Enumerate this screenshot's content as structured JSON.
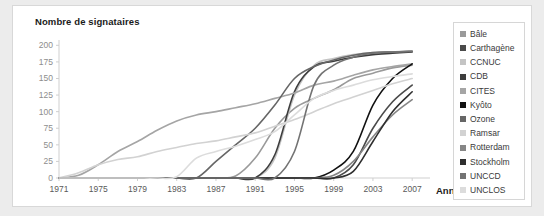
{
  "card": {
    "background": "#ffffff",
    "page_background": "#ececec"
  },
  "chart_data": {
    "type": "line",
    "title": "Nombre de signataires",
    "xlabel": "Année",
    "ylabel": "Nombre de signataires",
    "xlim": [
      1971,
      2008
    ],
    "ylim": [
      0,
      205
    ],
    "grid": false,
    "legend_position": "right",
    "xticks": [
      1971,
      1975,
      1979,
      1983,
      1987,
      1991,
      1995,
      1999,
      2003,
      2007
    ],
    "yticks": [
      0,
      25,
      50,
      75,
      100,
      125,
      150,
      175,
      200
    ],
    "x": [
      1971,
      1973,
      1975,
      1977,
      1979,
      1981,
      1983,
      1985,
      1987,
      1989,
      1991,
      1993,
      1995,
      1997,
      1999,
      2001,
      2003,
      2005,
      2007
    ],
    "series": [
      {
        "name": "Bâle",
        "color": "#9a9a9a",
        "values": [
          0,
          0,
          0,
          0,
          0,
          0,
          0,
          0,
          0,
          3,
          30,
          75,
          105,
          120,
          133,
          150,
          158,
          166,
          170
        ]
      },
      {
        "name": "Carthagène",
        "color": "#4a4a4a",
        "values": [
          0,
          0,
          0,
          0,
          0,
          0,
          0,
          0,
          0,
          0,
          0,
          0,
          0,
          0,
          0,
          20,
          75,
          115,
          140
        ]
      },
      {
        "name": "CCNUC",
        "color": "#c4c4c4",
        "values": [
          0,
          0,
          0,
          0,
          0,
          0,
          0,
          0,
          0,
          0,
          0,
          30,
          125,
          170,
          180,
          186,
          189,
          190,
          191
        ]
      },
      {
        "name": "CDB",
        "color": "#3d3d3d",
        "values": [
          0,
          0,
          0,
          0,
          0,
          0,
          0,
          0,
          0,
          0,
          0,
          35,
          130,
          168,
          176,
          182,
          186,
          188,
          190
        ]
      },
      {
        "name": "CITES",
        "color": "#a5a5a5",
        "values": [
          0,
          4,
          20,
          40,
          55,
          72,
          86,
          95,
          100,
          106,
          112,
          120,
          128,
          140,
          146,
          155,
          163,
          168,
          172
        ]
      },
      {
        "name": "Kyôto",
        "color": "#111111",
        "values": [
          0,
          0,
          0,
          0,
          0,
          0,
          0,
          0,
          0,
          0,
          0,
          0,
          0,
          0,
          12,
          40,
          110,
          150,
          172
        ]
      },
      {
        "name": "Ozone",
        "color": "#666666",
        "values": [
          0,
          0,
          0,
          0,
          0,
          0,
          0,
          0,
          25,
          50,
          75,
          110,
          150,
          168,
          178,
          185,
          189,
          190,
          191
        ]
      },
      {
        "name": "Ramsar",
        "color": "#d2d2d2",
        "values": [
          0,
          8,
          20,
          28,
          32,
          40,
          46,
          52,
          56,
          62,
          68,
          78,
          88,
          100,
          112,
          122,
          132,
          142,
          150
        ]
      },
      {
        "name": "Rotterdam",
        "color": "#868686",
        "values": [
          0,
          0,
          0,
          0,
          0,
          0,
          0,
          0,
          0,
          0,
          0,
          0,
          0,
          0,
          4,
          25,
          62,
          95,
          118
        ]
      },
      {
        "name": "Stockholm",
        "color": "#2e2e2e",
        "values": [
          0,
          0,
          0,
          0,
          0,
          0,
          0,
          0,
          0,
          0,
          0,
          0,
          0,
          0,
          0,
          10,
          55,
          100,
          130
        ]
      },
      {
        "name": "UNCCD",
        "color": "#737373",
        "values": [
          0,
          0,
          0,
          0,
          0,
          0,
          0,
          0,
          0,
          0,
          0,
          0,
          40,
          140,
          170,
          182,
          188,
          190,
          191
        ]
      },
      {
        "name": "UNCLOS",
        "color": "#dcdcdc",
        "values": [
          0,
          0,
          0,
          0,
          0,
          0,
          2,
          30,
          40,
          48,
          58,
          70,
          95,
          120,
          132,
          140,
          148,
          153,
          157
        ]
      }
    ]
  }
}
